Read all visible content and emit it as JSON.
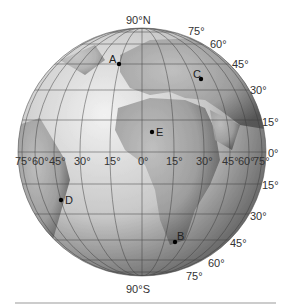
{
  "figure": {
    "type": "globe-diagram",
    "pole_labels": {
      "north": "90°N",
      "south": "90°S"
    },
    "latitude_labels_right_north": [
      "75°",
      "60°",
      "45°",
      "30°",
      "15°"
    ],
    "equator_label": "0°",
    "latitude_labels_right_south": [
      "15°",
      "30°",
      "45°",
      "60°",
      "75°"
    ],
    "longitude_labels": [
      "75°",
      "60°",
      "45°",
      "30°",
      "15°",
      "0°",
      "15°",
      "30°",
      "45°",
      "60°",
      "75°"
    ],
    "points": [
      {
        "id": "A",
        "label": "A"
      },
      {
        "id": "B",
        "label": "B"
      },
      {
        "id": "C",
        "label": "C"
      },
      {
        "id": "D",
        "label": "D"
      },
      {
        "id": "E",
        "label": "E"
      }
    ]
  },
  "colors": {
    "ocean_light": "#e8e8e8",
    "ocean_dark": "#6a6a6a",
    "land": "#a9a9a9",
    "grid": "#3a3a3a",
    "point": "#000000",
    "rule": "#cccccc"
  }
}
